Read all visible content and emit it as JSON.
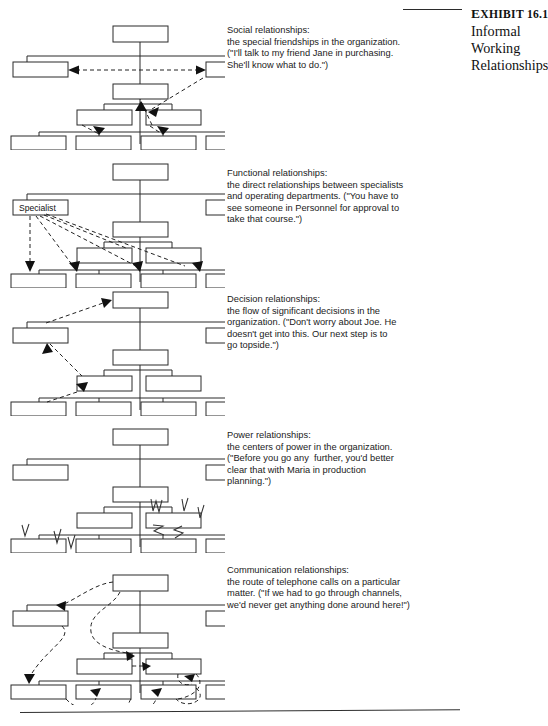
{
  "exhibit": {
    "rule": "horizontal-rule",
    "number_prefix": "E",
    "number": "XHIBIT 16.1",
    "title_line1": "Informal",
    "title_line2": "Working",
    "title_line3": "Relationships"
  },
  "sections": [
    {
      "id": "social",
      "heading": "Social relationships:",
      "lines": [
        "the special friendships in the organization.",
        "(\"I'll talk to my friend Jane in purchasing.",
        "She'll know what to do.\")"
      ],
      "chart": {
        "name": "social-relationships-org-chart",
        "connector_style": "dashed-arrow",
        "box_label": ""
      }
    },
    {
      "id": "functional",
      "heading": "Functional relationships:",
      "lines": [
        "the direct relationships between specialists",
        "and operating departments. (\"You have to",
        "see someone in Personnel for approval to",
        "take that course.\")"
      ],
      "chart": {
        "name": "functional-relationships-org-chart",
        "connector_style": "dashed-arrow",
        "box_label": "Specialist"
      }
    },
    {
      "id": "decision",
      "heading": "Decision relationships:",
      "lines": [
        "the flow of significant decisions in the",
        "organization. (\"Don't worry about Joe. He",
        "doesn't get into this. Our next step is to",
        "go topside.\")"
      ],
      "chart": {
        "name": "decision-relationships-org-chart",
        "connector_style": "dashed-arrow",
        "box_label": ""
      }
    },
    {
      "id": "power",
      "heading": "Power relationships:",
      "lines": [
        "the centers of power in the organization.",
        "(\"Before you go any  further, you'd better",
        "clear that with Maria in production",
        "planning.\")"
      ],
      "chart": {
        "name": "power-relationships-org-chart",
        "connector_style": "lightning-bolt",
        "box_label": ""
      }
    },
    {
      "id": "communication",
      "heading": "Communication relationships:",
      "lines": [
        "the route of telephone calls on a particular",
        "matter. (\"If we had to go through channels,",
        "we'd never get anything done around here!\")"
      ],
      "chart": {
        "name": "communication-relationships-org-chart",
        "connector_style": "curved-dashed-arrow",
        "box_label": ""
      }
    }
  ],
  "colors": {
    "line": "#2b2b2b",
    "box_fill": "#ffffff",
    "text": "#1b1b1b"
  }
}
